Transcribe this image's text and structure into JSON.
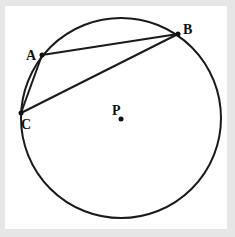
{
  "diagram": {
    "circle": {
      "cx": 121,
      "cy": 118,
      "r": 100,
      "stroke": "#1a1a1a"
    },
    "points": [
      {
        "id": "A",
        "label": "A",
        "x": 42,
        "y": 55,
        "lx": 26,
        "ly": 60
      },
      {
        "id": "B",
        "label": "B",
        "x": 178,
        "y": 34,
        "lx": 183,
        "ly": 34
      },
      {
        "id": "C",
        "label": "C",
        "x": 21,
        "y": 113,
        "lx": 21,
        "ly": 129
      },
      {
        "id": "P",
        "label": "P",
        "x": 121,
        "y": 119,
        "lx": 112,
        "ly": 115
      }
    ],
    "segments": [
      {
        "from": "A",
        "to": "B"
      },
      {
        "from": "B",
        "to": "C"
      },
      {
        "from": "C",
        "to": "A"
      }
    ],
    "colors": {
      "background": "#e6e6e6",
      "panel": "#ffffff",
      "ink": "#1a1a1a"
    }
  }
}
